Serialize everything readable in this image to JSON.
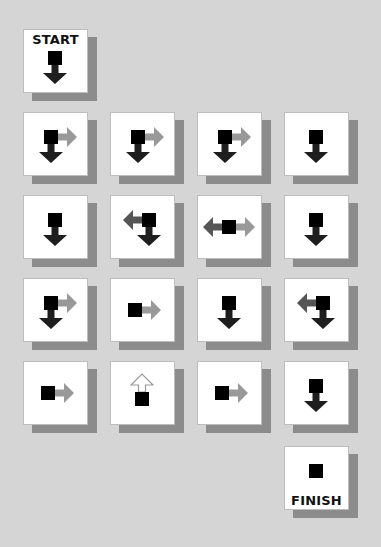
{
  "puzzle": {
    "start_label": "START",
    "finish_label": "FINISH",
    "colors": {
      "background": "#d5d5d5",
      "tile_face": "#ffffff",
      "tile_shadow": "#8c8c8c",
      "square": "#000000",
      "arrow_down": "#1e1e1e",
      "arrow_left": "#555555",
      "arrow_right": "#999999",
      "arrow_up_outline": "#9a9a9a"
    },
    "start": {
      "row": 0,
      "col": 0,
      "arrows": [
        "down"
      ]
    },
    "grid": [
      [
        {
          "arrows": [
            "down",
            "right"
          ]
        },
        {
          "arrows": [
            "down",
            "right"
          ]
        },
        {
          "arrows": [
            "down",
            "right"
          ]
        },
        {
          "arrows": [
            "down"
          ]
        }
      ],
      [
        {
          "arrows": [
            "down"
          ]
        },
        {
          "arrows": [
            "left",
            "down"
          ]
        },
        {
          "arrows": [
            "left",
            "right"
          ]
        },
        {
          "arrows": [
            "down"
          ]
        }
      ],
      [
        {
          "arrows": [
            "down",
            "right"
          ]
        },
        {
          "arrows": [
            "right"
          ]
        },
        {
          "arrows": [
            "down"
          ]
        },
        {
          "arrows": [
            "left",
            "down"
          ]
        }
      ],
      [
        {
          "arrows": [
            "right"
          ]
        },
        {
          "arrows": [
            "up"
          ]
        },
        {
          "arrows": [
            "right"
          ]
        },
        {
          "arrows": [
            "down"
          ]
        }
      ]
    ],
    "finish": {
      "col": 3,
      "arrows": []
    }
  }
}
